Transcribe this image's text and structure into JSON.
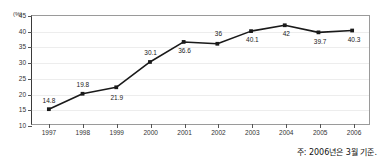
{
  "chart_data": {
    "type": "line",
    "title": "",
    "xlabel": "",
    "ylabel": "(%)",
    "unit_label": "(%)",
    "categories": [
      "1997",
      "1998",
      "1999",
      "2000",
      "2001",
      "2002",
      "2003",
      "2004",
      "2005",
      "2006"
    ],
    "values": [
      14.8,
      19.8,
      21.9,
      30.1,
      36.6,
      36,
      40.1,
      42,
      39.7,
      40.3
    ],
    "point_labels": [
      "14.8",
      "19.8",
      "21.9",
      "30.1",
      "36.6",
      "36",
      "40.1",
      "42",
      "39.7",
      "40.3"
    ],
    "label_positions": [
      "above",
      "above",
      "below",
      "above",
      "below",
      "above",
      "below",
      "below",
      "below",
      "below"
    ],
    "ylim": [
      10,
      45
    ],
    "yticks": [
      10,
      15,
      20,
      25,
      30,
      35,
      40,
      45
    ],
    "ytick_labels": [
      "10",
      "15",
      "20",
      "25",
      "30",
      "35",
      "40",
      "45"
    ],
    "grid": true,
    "legend": "none",
    "series_color": "#1a1a1a",
    "marker": "square",
    "grid_color": "#ededed",
    "frame_color": "#9a9a9a"
  },
  "footnote": {
    "text": "주: 2006년은 3월 기준."
  }
}
